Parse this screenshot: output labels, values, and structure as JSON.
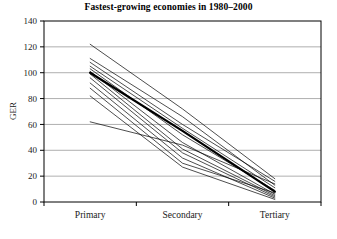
{
  "chart_data": {
    "type": "line",
    "title": "Fastest-growing economies in 1980–2000",
    "xlabel": "",
    "ylabel": "GER",
    "categories": [
      "Primary",
      "Secondary",
      "Tertiary"
    ],
    "ylim": [
      0,
      140
    ],
    "ytick_step": 20,
    "yticks": [
      0,
      20,
      40,
      60,
      80,
      100,
      120,
      140
    ],
    "ytick_labels": [
      "0",
      "20",
      "40",
      "60",
      "80",
      "100",
      "120",
      "140"
    ],
    "grid": "horizontal",
    "legend": "none",
    "line_color": "#000000",
    "series": [
      {
        "name": "economy-1",
        "values": [
          122,
          72,
          18
        ],
        "emphasis": false
      },
      {
        "name": "economy-2",
        "values": [
          111,
          66,
          13
        ],
        "emphasis": false
      },
      {
        "name": "economy-3",
        "values": [
          108,
          60,
          16
        ],
        "emphasis": false
      },
      {
        "name": "economy-4",
        "values": [
          105,
          57,
          11
        ],
        "emphasis": false
      },
      {
        "name": "economy-5",
        "values": [
          103,
          52,
          9
        ],
        "emphasis": false
      },
      {
        "name": "economy-6",
        "values": [
          101,
          46,
          6
        ],
        "emphasis": false
      },
      {
        "name": "economy-7",
        "values": [
          100,
          55,
          8
        ],
        "emphasis": true
      },
      {
        "name": "economy-8",
        "values": [
          99,
          41,
          5
        ],
        "emphasis": false
      },
      {
        "name": "economy-9",
        "values": [
          96,
          38,
          4
        ],
        "emphasis": false
      },
      {
        "name": "economy-10",
        "values": [
          92,
          34,
          3
        ],
        "emphasis": false
      },
      {
        "name": "economy-11",
        "values": [
          88,
          30,
          7
        ],
        "emphasis": false
      },
      {
        "name": "economy-12",
        "values": [
          82,
          27,
          2
        ],
        "emphasis": false
      },
      {
        "name": "economy-13",
        "values": [
          62,
          44,
          14
        ],
        "emphasis": false
      }
    ]
  },
  "axes": {
    "y_title": "GER"
  }
}
